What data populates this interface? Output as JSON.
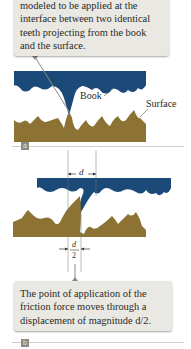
{
  "figure_a": {
    "callout_lines": [
      "modeled to be applied at the",
      "interface between two identical",
      "teeth projecting from the book",
      "and the surface."
    ],
    "book_label": "Book",
    "surface_label": "Surface",
    "panel_label": "a"
  },
  "figure_b": {
    "dimension_top": "d",
    "dimension_bottom_numerator": "d",
    "dimension_bottom_denominator": "2",
    "callout_lines": [
      "The point of application of the",
      "friction force moves through a",
      "displacement of magnitude d/2."
    ],
    "panel_label": "b"
  },
  "colors": {
    "book": "#1b4a78",
    "surface": "#8c7333",
    "callout_bg": "#e9e8e3",
    "badge": "#8b8b85"
  }
}
